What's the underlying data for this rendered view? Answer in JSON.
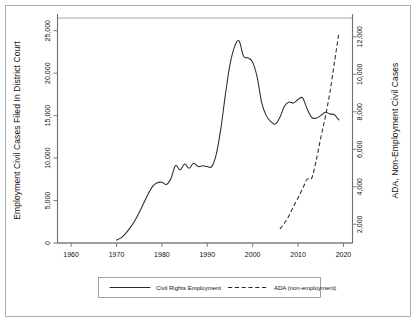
{
  "chart_data": {
    "type": "line",
    "title": "",
    "xlabel": "Year",
    "ylabel": "Employment Civil Cases Filed In District Court",
    "ylabel_right": "ADA, Non-Employment Civil Cases",
    "xlim": [
      1957,
      2022
    ],
    "ylim": [
      0,
      26500
    ],
    "ylim_right": [
      1000,
      13000
    ],
    "grid": true,
    "legend_position": "below-axis-center",
    "xticks": [
      1960,
      1970,
      1980,
      1990,
      2000,
      2010,
      2020
    ],
    "xtick_labels": [
      "1960",
      "1970",
      "1980",
      "1990",
      "2000",
      "2010",
      "2020"
    ],
    "yticks": [
      0,
      5000,
      10000,
      15000,
      20000,
      25000
    ],
    "ytick_labels": [
      "0",
      "5,000",
      "10,000",
      "15,000",
      "20,000",
      "25,000"
    ],
    "yticks_right": [
      2000,
      4000,
      6000,
      8000,
      10000,
      12000
    ],
    "ytick_labels_right": [
      "2,000",
      "4,000",
      "6,000",
      "8,000",
      "10,000",
      "12,000"
    ],
    "series": [
      {
        "name": "Civil Rights Employment",
        "style": "solid",
        "axis": "left",
        "x": [
          1970,
          1971,
          1972,
          1973,
          1974,
          1975,
          1976,
          1977,
          1978,
          1979,
          1980,
          1981,
          1982,
          1983,
          1984,
          1985,
          1986,
          1987,
          1988,
          1989,
          1990,
          1991,
          1992,
          1993,
          1994,
          1995,
          1996,
          1997,
          1998,
          1999,
          2000,
          2001,
          2002,
          2003,
          2004,
          2005,
          2006,
          2007,
          2008,
          2009,
          2010,
          2011,
          2012,
          2013,
          2014,
          2015,
          2016,
          2017,
          2018,
          2019
        ],
        "y": [
          350,
          600,
          1100,
          1800,
          2600,
          3600,
          4700,
          5800,
          6700,
          7100,
          7150,
          6900,
          7600,
          9100,
          8600,
          9300,
          8800,
          9400,
          9000,
          9100,
          9000,
          9000,
          10500,
          13500,
          17500,
          21000,
          23100,
          23800,
          22000,
          21800,
          21300,
          19500,
          16500,
          15000,
          14300,
          14000,
          14800,
          16100,
          16600,
          16500,
          16900,
          17100,
          15800,
          14800,
          14700,
          15000,
          15400,
          15200,
          15100,
          14500
        ]
      },
      {
        "name": "ADA (non-employment)",
        "style": "dashed",
        "axis": "right",
        "x": [
          2006,
          2007,
          2008,
          2009,
          2010,
          2011,
          2012,
          2013,
          2014,
          2015,
          2016,
          2017,
          2018,
          2019
        ],
        "y": [
          1750,
          2050,
          2450,
          2950,
          3400,
          3900,
          4400,
          4450,
          5400,
          6600,
          7700,
          9000,
          10600,
          12200
        ]
      }
    ]
  },
  "legend": {
    "items": [
      {
        "label": "Civil Rights Employment",
        "style": "solid"
      },
      {
        "label": "ADA (non-employment)",
        "style": "dashed"
      }
    ]
  }
}
